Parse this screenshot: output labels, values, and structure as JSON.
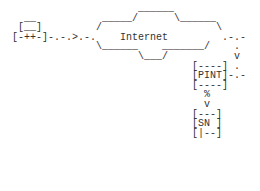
{
  "diagram": {
    "type": "ascii-network-diagram",
    "labels": {
      "cloud": "Internet",
      "router": "PINT",
      "switch": "SN"
    },
    "lines": [
      "                     ______",
      "  __           _____/      \\______",
      " [__]         /                   \\",
      "[-++-]-.-.>.-.    Internet         .-.-",
      "              \\______    _______/    .",
      "                     \\___/           v",
      "                              [----] .",
      "                              [PINT]-.-",
      "                              [----]",
      "                                %",
      "                                v",
      "                              [---]",
      "                              [SN ]",
      "                              [|--]"
    ]
  }
}
